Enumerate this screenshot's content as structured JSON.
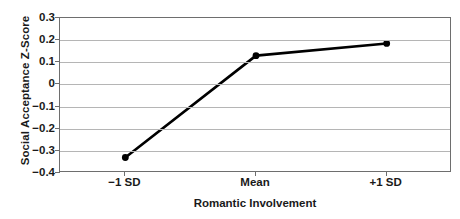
{
  "chart_data": {
    "type": "line",
    "title": "",
    "xlabel": "Romantic Involvement",
    "ylabel": "Social Acceptance Z-Score",
    "categories": [
      "−1 SD",
      "Mean",
      "+1 SD"
    ],
    "series": [
      {
        "name": "Social Acceptance",
        "values": [
          -0.33,
          0.13,
          0.185
        ]
      }
    ],
    "ylim": [
      -0.4,
      0.3
    ],
    "yticks": [
      0.3,
      0.2,
      0.1,
      0,
      -0.1,
      -0.2,
      -0.3,
      -0.4
    ],
    "ytick_labels": [
      "0.3",
      "0.2",
      "0.1",
      "0",
      "−0.1",
      "−0.2",
      "−0.3",
      "−0.4"
    ],
    "grid": "horizontal",
    "legend": "none",
    "marker": "filled-circle",
    "line_color": "#000000",
    "grid_color": "#b5b5b5",
    "axis_color": "#6e6e6e",
    "background_color": "#ffffff"
  }
}
